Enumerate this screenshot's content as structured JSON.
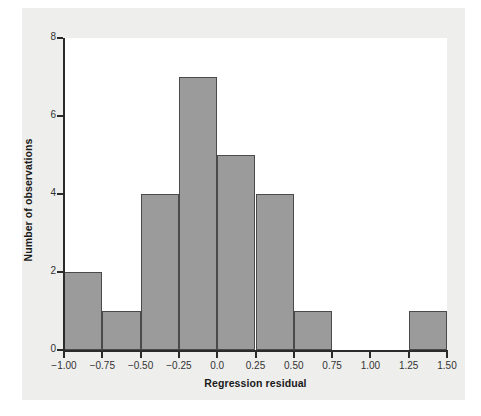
{
  "chart_data": {
    "type": "bar",
    "title": "",
    "subtitle": "",
    "xlabel": "Regression residual",
    "ylabel": "Number of observations",
    "xlim": [
      -1.0,
      1.5
    ],
    "ylim": [
      0,
      8
    ],
    "grid": false,
    "legend": null,
    "bin_width": 0.25,
    "bin_edges": [
      -1.0,
      -0.75,
      -0.5,
      -0.25,
      0.0,
      0.25,
      0.5,
      0.75,
      1.0,
      1.25,
      1.5
    ],
    "categories": [
      "-1.00 to -0.75",
      "-0.75 to -0.50",
      "-0.50 to -0.25",
      "-0.25 to 0.00",
      "0.00 to 0.25",
      "0.25 to 0.50",
      "0.50 to 0.75",
      "0.75 to 1.00",
      "1.00 to 1.25",
      "1.25 to 1.50"
    ],
    "values": [
      2,
      1,
      4,
      7,
      5,
      4,
      1,
      0,
      0,
      1
    ],
    "x_tick_labels": [
      "-1.00",
      "-0.75",
      "-0.50",
      "-0.25",
      "0.0",
      "0.25",
      "0.50",
      "0.75",
      "1.00",
      "1.25",
      "1.50"
    ],
    "x_tick_values": [
      -1.0,
      -0.75,
      -0.5,
      -0.25,
      0.0,
      0.25,
      0.5,
      0.75,
      1.0,
      1.25,
      1.5
    ],
    "y_tick_labels": [
      "0",
      "2",
      "4",
      "6",
      "8"
    ],
    "y_tick_values": [
      0,
      2,
      4,
      6,
      8
    ],
    "colors": {
      "bar_fill": "#9b9b9b",
      "bar_edge": "#4a4a4a",
      "axis": "#2b2b2b",
      "plot_background": "#ffffff",
      "panel_background": "#eeeeec",
      "text": "#1a1a1a"
    },
    "total_observations": 25
  }
}
